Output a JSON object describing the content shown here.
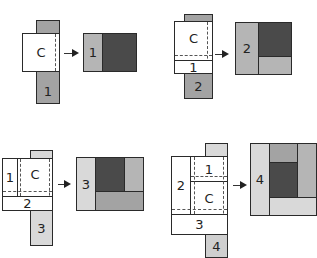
{
  "diagram": {
    "type": "quilt-block-assembly-steps",
    "colors": {
      "center_unit": "#ffffff",
      "strip_medium": "#a3a3a3",
      "strip_light": "#cfcfcf",
      "center_dark": "#4a4a4a",
      "outline": "#2a2a2a"
    },
    "steps": [
      {
        "step": 1,
        "layout_labels": {
          "center": "C",
          "strip": "1"
        },
        "result_labels": {
          "strip": "1"
        }
      },
      {
        "step": 2,
        "layout_labels": {
          "center": "C",
          "strip_prev": "1",
          "strip": "2"
        },
        "result_labels": {
          "strip": "2"
        }
      },
      {
        "step": 3,
        "layout_labels": {
          "strip_left": "1",
          "center": "C",
          "strip_prev": "2",
          "strip": "3"
        },
        "result_labels": {
          "strip": "3"
        }
      },
      {
        "step": 4,
        "layout_labels": {
          "strip_top": "1",
          "strip_left": "2",
          "center": "C",
          "strip_prev": "3",
          "strip": "4"
        },
        "result_labels": {
          "strip": "4"
        }
      }
    ]
  }
}
